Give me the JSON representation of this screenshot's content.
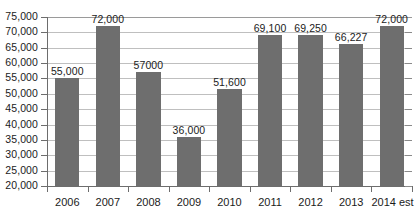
{
  "chart_data": {
    "type": "bar",
    "title": "",
    "xlabel": "",
    "ylabel": "",
    "categories": [
      "2006",
      "2007",
      "2008",
      "2009",
      "2010",
      "2011",
      "2012",
      "2013",
      "2014 est"
    ],
    "values": [
      55000,
      72000,
      57000,
      36000,
      51600,
      69100,
      69250,
      66227,
      72000
    ],
    "data_labels": [
      "55,000",
      "72,000",
      "57000",
      "36,000",
      "51,600",
      "69,100",
      "69,250",
      "66,227",
      "72,000"
    ],
    "ylim": [
      20000,
      75000
    ],
    "ytick_labels": [
      "75,000",
      "70,000",
      "65,000",
      "60,000",
      "55,000",
      "50,000",
      "45,000",
      "40,000",
      "35,000",
      "30,000",
      "25,000",
      "20,000"
    ],
    "ytick_values": [
      75000,
      70000,
      65000,
      60000,
      55000,
      50000,
      45000,
      40000,
      35000,
      30000,
      25000,
      20000
    ],
    "grid": true,
    "legend": false,
    "legend_position": "none",
    "series": [
      {
        "name": "Series 1",
        "values": [
          55000,
          72000,
          57000,
          36000,
          51600,
          69100,
          69250,
          66227,
          72000
        ]
      }
    ],
    "colors": {
      "bar": "#6e6e6e",
      "gridline": "#bfbfbf",
      "axis": "#6d6d6d",
      "text": "#1b1b1b",
      "background": "#ffffff"
    }
  }
}
